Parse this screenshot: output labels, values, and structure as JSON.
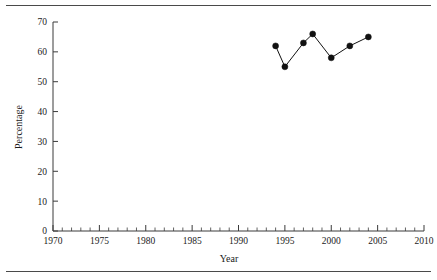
{
  "figure": {
    "background_color": "#ffffff",
    "foreground_color": "#1a1a1a",
    "rule_color": "#4a4a4a",
    "top_rule": "horizontal-rule",
    "bottom_rule": "horizontal-rule"
  },
  "chart_data": {
    "type": "line",
    "title": "",
    "subtitle": "",
    "xlabel": "Year",
    "ylabel": "Percentage",
    "xlim": [
      1970,
      2010
    ],
    "ylim": [
      0,
      70
    ],
    "grid": false,
    "legend": null,
    "legend_position": "none",
    "marker": "filled-circle",
    "marker_color": "#111111",
    "line_color": "#111111",
    "x_major_ticks": [
      1970,
      1975,
      1980,
      1985,
      1990,
      1995,
      2000,
      2005,
      2010
    ],
    "x_major_tick_labels": [
      "1970",
      "1975",
      "1980",
      "1985",
      "1990",
      "1995",
      "2000",
      "2005",
      "2010"
    ],
    "x_minor_tick_step": 1,
    "y_major_ticks": [
      0,
      10,
      20,
      30,
      40,
      50,
      60,
      70
    ],
    "y_major_tick_labels": [
      "0",
      "10",
      "20",
      "30",
      "40",
      "50",
      "60",
      "70"
    ],
    "x": [
      1994,
      1995,
      1997,
      1998,
      2000,
      2002,
      2004
    ],
    "values": [
      62,
      55,
      63,
      66,
      58,
      62,
      65
    ],
    "series": [
      {
        "name": "Percentage",
        "x": [
          1994,
          1995,
          1997,
          1998,
          2000,
          2002,
          2004
        ],
        "values": [
          62,
          55,
          63,
          66,
          58,
          62,
          65
        ]
      }
    ]
  }
}
